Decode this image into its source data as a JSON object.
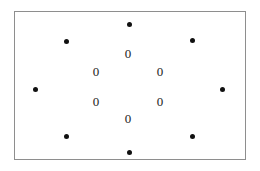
{
  "figure": {
    "background_color": "#ffffff",
    "frame": {
      "border_color": "#8e8e8e",
      "fill_color": "#ffffff",
      "x": 14,
      "y": 11,
      "width": 232,
      "height": 149
    },
    "dot_color": "#111111",
    "dot_diameter": 5,
    "label_color": "#1a1a1a",
    "label_font_size": 13,
    "dots": [
      {
        "name": "dot-top-center",
        "label": "top-center",
        "x": 129,
        "y": 24
      },
      {
        "name": "dot-top-left",
        "label": "top-left",
        "x": 66,
        "y": 41
      },
      {
        "name": "dot-top-right",
        "label": "top-right",
        "x": 192,
        "y": 40
      },
      {
        "name": "dot-middle-left",
        "label": "middle-left",
        "x": 35,
        "y": 89
      },
      {
        "name": "dot-middle-right",
        "label": "middle-right",
        "x": 222,
        "y": 89
      },
      {
        "name": "dot-bottom-left",
        "label": "bottom-left",
        "x": 66,
        "y": 136
      },
      {
        "name": "dot-bottom-right",
        "label": "bottom-right",
        "x": 192,
        "y": 136
      },
      {
        "name": "dot-bottom-center",
        "label": "bottom-center",
        "x": 129,
        "y": 152
      }
    ],
    "zeros": [
      {
        "name": "zero-top-center",
        "text": "0",
        "x": 128,
        "y": 53
      },
      {
        "name": "zero-upper-left",
        "text": "0",
        "x": 96,
        "y": 71
      },
      {
        "name": "zero-upper-right",
        "text": "0",
        "x": 160,
        "y": 71
      },
      {
        "name": "zero-lower-left",
        "text": "0",
        "x": 96,
        "y": 101
      },
      {
        "name": "zero-lower-right",
        "text": "0",
        "x": 160,
        "y": 101
      },
      {
        "name": "zero-bottom-center",
        "text": "0",
        "x": 128,
        "y": 118
      }
    ]
  }
}
